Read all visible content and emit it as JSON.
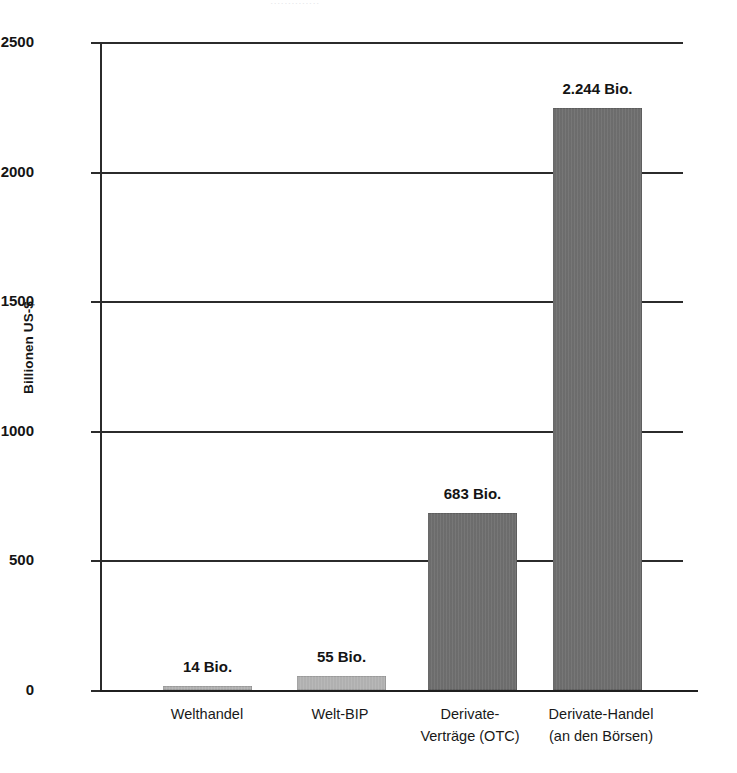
{
  "clipped_header_text": "..............",
  "chart_data": {
    "type": "bar",
    "title": "",
    "xlabel": "",
    "ylabel": "Billionen US-$",
    "ylim": [
      0,
      2500
    ],
    "yticks": [
      0,
      500,
      1000,
      1500,
      2000,
      2500
    ],
    "ytick_labels": [
      "0",
      "500",
      "1000",
      "1500",
      "2000",
      "2500"
    ],
    "grid": true,
    "legend": "none",
    "categories": [
      "Welthandel",
      "Welt-BIP",
      "Derivate-Verträge (OTC)",
      "Derivate-Handel (an den Börsen)"
    ],
    "category_lines": [
      [
        "Welthandel"
      ],
      [
        "Welt-BIP"
      ],
      [
        "Derivate-",
        "Verträge (OTC)"
      ],
      [
        "Derivate-Handel",
        "(an den Börsen)"
      ]
    ],
    "values": [
      14,
      55,
      683,
      2244
    ],
    "value_labels": [
      "14 Bio.",
      "55 Bio.",
      "683 Bio.",
      "2.244 Bio."
    ],
    "bar_colors": [
      "#b4b4b4",
      "#b4b4b4",
      "#6f6f6f",
      "#6f6f6f"
    ],
    "units": "Billionen US-$"
  }
}
